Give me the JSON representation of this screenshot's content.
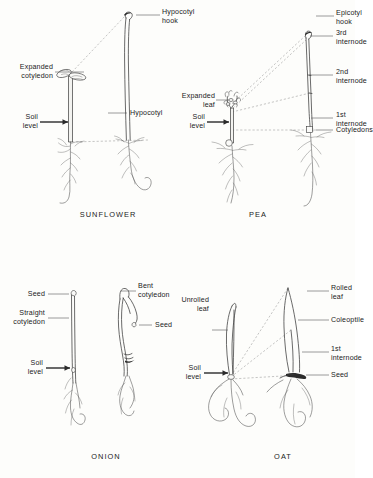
{
  "figure": {
    "background_color": "#fdfdfb",
    "ink_color": "#1b1b1b"
  },
  "panels": [
    {
      "id": "sunflower",
      "caption": "SUNFLOWER",
      "labels": [
        {
          "name": "hypocotyl-hook",
          "text": "Hypocotyl\nhook"
        },
        {
          "name": "expanded-cotyledon",
          "text": "Expanded\ncotyledon"
        },
        {
          "name": "hypocotyl",
          "text": "Hypocotyl"
        },
        {
          "name": "soil-level",
          "text": "Soil\nlevel"
        }
      ]
    },
    {
      "id": "pea",
      "caption": "PEA",
      "labels": [
        {
          "name": "epicotyl-hook",
          "text": "Epicotyl\nhook"
        },
        {
          "name": "third-internode",
          "text": "3rd\ninternode"
        },
        {
          "name": "second-internode",
          "text": "2nd\ninternode"
        },
        {
          "name": "first-internode",
          "text": "1st\ninternode"
        },
        {
          "name": "cotyledons",
          "text": "Cotyledons"
        },
        {
          "name": "expanded-leaf",
          "text": "Expanded\nleaf"
        },
        {
          "name": "soil-level",
          "text": "Soil\nlevel"
        }
      ]
    },
    {
      "id": "onion",
      "caption": "ONION",
      "labels": [
        {
          "name": "seed-left",
          "text": "Seed"
        },
        {
          "name": "straight-cotyledon",
          "text": "Straight\ncotyledon"
        },
        {
          "name": "bent-cotyledon",
          "text": "Bent\ncotyledon"
        },
        {
          "name": "seed-right",
          "text": "Seed"
        },
        {
          "name": "soil-level",
          "text": "Soil\nlevel"
        }
      ]
    },
    {
      "id": "oat",
      "caption": "OAT",
      "labels": [
        {
          "name": "unrolled-leaf",
          "text": "Unrolled\nleaf"
        },
        {
          "name": "rolled-leaf",
          "text": "Rolled\nleaf"
        },
        {
          "name": "coleoptile",
          "text": "Coleoptile"
        },
        {
          "name": "first-internode",
          "text": "1st\ninternode"
        },
        {
          "name": "seed",
          "text": "Seed"
        },
        {
          "name": "soil-level",
          "text": "Soil\nlevel"
        }
      ]
    }
  ]
}
